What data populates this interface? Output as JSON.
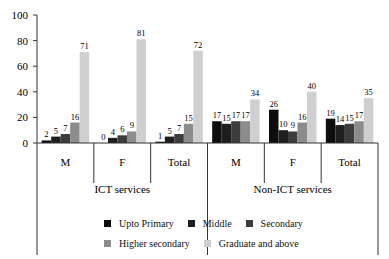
{
  "chart_data": {
    "type": "bar",
    "title": "",
    "xlabel": "",
    "ylabel": "",
    "ylim": [
      0,
      100
    ],
    "yticks": [
      0,
      20,
      40,
      60,
      80,
      100
    ],
    "grid": false,
    "legend_position": "bottom",
    "groups": [
      {
        "label": "ICT services",
        "categories": [
          "M",
          "F",
          "Total"
        ]
      },
      {
        "label": "Non-ICT services",
        "categories": [
          "M",
          "F",
          "Total"
        ]
      }
    ],
    "categories": [
      "ICT services - M",
      "ICT services - F",
      "ICT services - Total",
      "Non-ICT services - M",
      "Non-ICT services - F",
      "Non-ICT services - Total"
    ],
    "category_short": [
      "M",
      "F",
      "Total",
      "M",
      "F",
      "Total"
    ],
    "series": [
      {
        "name": "Upto Primary",
        "color": "#0d0d0d",
        "values": [
          2,
          0,
          1,
          17,
          26,
          19
        ]
      },
      {
        "name": "Middle",
        "color": "#1e1e1e",
        "values": [
          5,
          4,
          5,
          15,
          10,
          14
        ]
      },
      {
        "name": "Secondary",
        "color": "#3c3c3c",
        "values": [
          7,
          6,
          7,
          17,
          9,
          15
        ]
      },
      {
        "name": "Higher secondary",
        "color": "#8c8c8c",
        "values": [
          16,
          9,
          15,
          17,
          16,
          17
        ]
      },
      {
        "name": "Graduate and above",
        "color": "#cfcfcf",
        "values": [
          71,
          81,
          72,
          34,
          40,
          35
        ]
      }
    ]
  },
  "legend": {
    "rows": [
      [
        0,
        1,
        2
      ],
      [
        3,
        4
      ]
    ]
  }
}
